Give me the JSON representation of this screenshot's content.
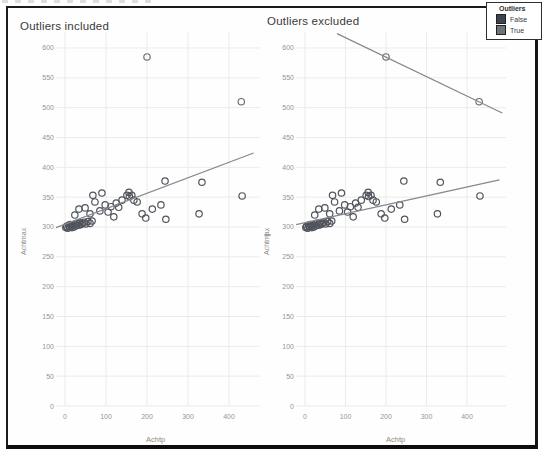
{
  "page": {
    "cropped_text_note": "partial cut-off text row at very top of scan"
  },
  "legend": {
    "title": "Outliers",
    "items": [
      {
        "label": "False",
        "color": "#3f434c"
      },
      {
        "label": "True",
        "color": "#6f7277"
      }
    ]
  },
  "colors": {
    "frame_border": "#1b1b1b",
    "grid": "#edebe6",
    "tick_text": "#98948f",
    "title_text": "#3a3a3a",
    "trend_line": "#85888c",
    "point_false": "#50545c",
    "point_true": "#6e7175"
  },
  "chart_data": {
    "type": "scatter",
    "xlabel": "Achtp",
    "ylabel": "Achtmax",
    "x_ticks": [
      0,
      100,
      200,
      300,
      400
    ],
    "y_ticks": [
      0,
      50,
      100,
      150,
      200,
      250,
      300,
      350,
      400,
      450,
      500,
      550,
      600
    ],
    "xlim": [
      -25,
      480
    ],
    "ylim": [
      0,
      627
    ],
    "grid": true,
    "series": [
      {
        "name": "False",
        "color": "#50545c",
        "points": [
          [
            2,
            299
          ],
          [
            4,
            301
          ],
          [
            7,
            298
          ],
          [
            9,
            303
          ],
          [
            11,
            300
          ],
          [
            13,
            304
          ],
          [
            15,
            301
          ],
          [
            17,
            299
          ],
          [
            19,
            303
          ],
          [
            22,
            300
          ],
          [
            25,
            305
          ],
          [
            27,
            302
          ],
          [
            30,
            306
          ],
          [
            33,
            303
          ],
          [
            36,
            307
          ],
          [
            39,
            304
          ],
          [
            43,
            306
          ],
          [
            47,
            308
          ],
          [
            51,
            305
          ],
          [
            56,
            309
          ],
          [
            61,
            306
          ],
          [
            66,
            310
          ],
          [
            24,
            320
          ],
          [
            34,
            330
          ],
          [
            49,
            332
          ],
          [
            61,
            322
          ],
          [
            68,
            353
          ],
          [
            73,
            342
          ],
          [
            85,
            327
          ],
          [
            90,
            357
          ],
          [
            98,
            337
          ],
          [
            105,
            325
          ],
          [
            112,
            334
          ],
          [
            119,
            317
          ],
          [
            125,
            340
          ],
          [
            131,
            333
          ],
          [
            139,
            345
          ],
          [
            151,
            353
          ],
          [
            156,
            358
          ],
          [
            157,
            351
          ],
          [
            163,
            353
          ],
          [
            168,
            345
          ],
          [
            176,
            342
          ],
          [
            188,
            322
          ],
          [
            197,
            315
          ],
          [
            213,
            330
          ],
          [
            234,
            337
          ],
          [
            244,
            377
          ],
          [
            246,
            313
          ],
          [
            327,
            322
          ],
          [
            334,
            375
          ],
          [
            432,
            352
          ]
        ]
      },
      {
        "name": "True",
        "color": "#6e7175",
        "points": [
          [
            200,
            585
          ],
          [
            430,
            510
          ]
        ]
      }
    ],
    "panels": [
      {
        "title": "Outliers included",
        "trend_lines": [
          {
            "fit": "all points",
            "from": [
              -22,
              299
            ],
            "to": [
              460,
              424
            ]
          }
        ]
      },
      {
        "title": "Outliers excluded",
        "trend_lines": [
          {
            "fit": "False group",
            "from": [
              -22,
              304
            ],
            "to": [
              480,
              379
            ]
          },
          {
            "fit": "True group",
            "from": [
              79,
              624
            ],
            "to": [
              487,
              491
            ]
          }
        ]
      }
    ]
  }
}
